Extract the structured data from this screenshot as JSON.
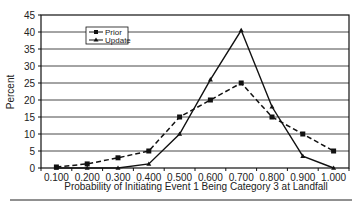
{
  "chart_data": {
    "type": "line",
    "title": "",
    "xlabel": "Probability of Initiating Event 1 Being Category 3 at Landfall",
    "ylabel": "Percent",
    "categories": [
      "0.100",
      "0.200",
      "0.300",
      "0.400",
      "0.500",
      "0.600",
      "0.700",
      "0.800",
      "0.900",
      "1.000"
    ],
    "yticks": [
      "0",
      "5",
      "10",
      "15",
      "20",
      "25",
      "30",
      "35",
      "40",
      "45"
    ],
    "ylim": [
      0,
      45
    ],
    "grid": true,
    "legend_position": "upper-left-inside",
    "series": [
      {
        "name": "Prior",
        "style": "dashed",
        "marker": "square",
        "values": [
          0.3,
          1.2,
          3,
          5,
          15,
          20,
          25,
          15,
          10,
          5
        ]
      },
      {
        "name": "Update",
        "style": "solid",
        "marker": "triangle",
        "values": [
          0,
          0,
          0,
          1.2,
          10,
          26,
          40.5,
          18,
          3.5,
          0
        ]
      }
    ]
  },
  "colors": {
    "line": "#111111",
    "grid": "#333333",
    "background": "#ffffff"
  }
}
